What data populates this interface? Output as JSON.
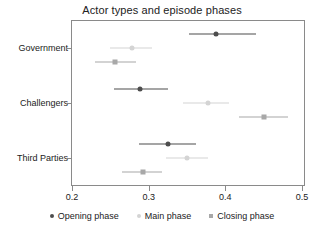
{
  "chart_data": {
    "type": "scatter",
    "title": "Actor types and episode phases",
    "xlabel": "",
    "ylabel": "",
    "xlim": [
      0.2,
      0.5
    ],
    "xticks": [
      0.2,
      0.3,
      0.4,
      0.5
    ],
    "xticklabels": [
      "0.2",
      "0.3",
      "0.4",
      "0.5"
    ],
    "grid": false,
    "legend_position": "bottom",
    "categories": [
      "Government",
      "Challengers",
      "Third Parties"
    ],
    "series": [
      {
        "name": "Opening phase",
        "marker": "circle",
        "color": "#4d4d4d",
        "values": [
          0.388,
          0.289,
          0.325
        ],
        "ci_low": [
          0.353,
          0.255,
          0.288
        ],
        "ci_high": [
          0.44,
          0.325,
          0.362
        ]
      },
      {
        "name": "Main phase",
        "marker": "circle",
        "color": "#d4d4d4",
        "values": [
          0.278,
          0.377,
          0.35
        ],
        "ci_low": [
          0.25,
          0.345,
          0.323
        ],
        "ci_high": [
          0.305,
          0.405,
          0.377
        ]
      },
      {
        "name": "Closing phase",
        "marker": "square",
        "color": "#a8a8a8",
        "values": [
          0.256,
          0.451,
          0.292
        ],
        "ci_low": [
          0.23,
          0.418,
          0.265
        ],
        "ci_high": [
          0.283,
          0.482,
          0.318
        ]
      }
    ],
    "legend": [
      "Opening phase",
      "Main phase",
      "Closing phase"
    ]
  },
  "axis": {
    "frame_color": "#8a8a8a",
    "tick_color": "#8a8a8a"
  }
}
